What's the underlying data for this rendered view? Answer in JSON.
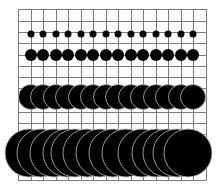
{
  "figure": {
    "width": 222,
    "height": 188,
    "background": "#ffffff",
    "grid": {
      "x_lines": [
        18,
        31,
        43,
        56,
        68,
        81,
        93,
        106,
        118,
        131,
        143,
        156,
        168,
        181,
        193,
        206
      ],
      "y_lines": [
        9,
        21,
        32,
        43,
        55,
        66,
        77,
        88,
        100,
        112,
        123,
        134,
        145,
        157,
        168,
        180
      ],
      "color": "#7a7a7a",
      "stroke_width": 1
    },
    "circle_color": "#000000",
    "circle_outline_color": "#bdbdbd",
    "rows": [
      {
        "name": "row-tiny-dots",
        "cy": 34,
        "r": 3.5,
        "cx": [
          31,
          43,
          56,
          68,
          81,
          93,
          106,
          118,
          131,
          143,
          156,
          168,
          181,
          193
        ]
      },
      {
        "name": "row-small-dots",
        "cy": 55,
        "r": 6,
        "cx": [
          31,
          43,
          56,
          68,
          81,
          93,
          106,
          118,
          131,
          143,
          156,
          168,
          181,
          193
        ]
      },
      {
        "name": "row-medium-circles",
        "cy": 97,
        "r": 12.5,
        "cx": [
          31,
          43,
          56,
          68,
          81,
          93,
          106,
          118,
          131,
          143,
          156,
          168,
          181,
          193
        ]
      },
      {
        "name": "row-large-circles",
        "cy": 153,
        "r": 24,
        "cx": [
          29,
          41,
          54,
          67,
          75,
          87,
          100,
          113,
          126,
          142,
          156,
          167,
          177,
          188
        ]
      }
    ]
  }
}
